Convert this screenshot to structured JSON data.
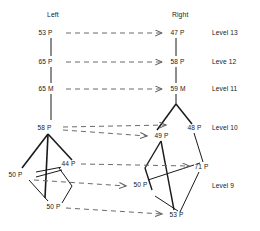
{
  "diagram": {
    "headers": [
      {
        "id": "left",
        "label": "Left",
        "x": 47,
        "y": 12
      },
      {
        "id": "right",
        "label": "Right",
        "x": 172,
        "y": 12
      }
    ],
    "levels": [
      {
        "id": "level-13",
        "label": "Level 13",
        "x": 212,
        "y": 33
      },
      {
        "id": "level-12",
        "label": "Leve 12",
        "x": 212,
        "y": 62
      },
      {
        "id": "level-11",
        "label": "Level 11",
        "x": 212,
        "y": 89
      },
      {
        "id": "level-10",
        "label": "Level 10",
        "x": 212,
        "y": 128
      },
      {
        "id": "level-9",
        "label": "Level 9",
        "x": 212,
        "y": 186
      }
    ],
    "nodes": [
      {
        "id": "n-l13",
        "label": "53 P",
        "side": "left",
        "level": "Level 13",
        "x": 47,
        "y": 33
      },
      {
        "id": "n-r13",
        "label": "47 P",
        "side": "right",
        "level": "Level 13",
        "x": 172,
        "y": 33
      },
      {
        "id": "n-l12",
        "label": "65 P",
        "side": "left",
        "level": "Leve 12",
        "x": 47,
        "y": 62
      },
      {
        "id": "n-r12",
        "label": "58 P",
        "side": "right",
        "level": "Leve 12",
        "x": 172,
        "y": 62
      },
      {
        "id": "n-l11",
        "label": "65 M",
        "side": "left",
        "level": "Level 11",
        "x": 47,
        "y": 89
      },
      {
        "id": "n-r11",
        "label": "59 M",
        "side": "right",
        "level": "Level 11",
        "x": 172,
        "y": 89
      },
      {
        "id": "n-l10",
        "label": "58 P",
        "side": "left",
        "level": "Level 10",
        "x": 44,
        "y": 128
      },
      {
        "id": "n-m10",
        "label": "49 P",
        "side": "right",
        "level": "Level 10",
        "x": 157,
        "y": 136
      },
      {
        "id": "n-r10",
        "label": "48 P",
        "side": "right",
        "level": "Level 10",
        "x": 190,
        "y": 128
      },
      {
        "id": "n-l9a",
        "label": "50 P",
        "side": "left",
        "level": "Level 9",
        "x": 15,
        "y": 175
      },
      {
        "id": "n-l9b",
        "label": "44 P",
        "side": "left",
        "level": "Level 9",
        "x": 63,
        "y": 164
      },
      {
        "id": "n-l9c",
        "label": "50 P",
        "side": "left",
        "level": "Level 9",
        "x": 49,
        "y": 207
      },
      {
        "id": "n-r9a",
        "label": "71 P",
        "side": "right",
        "level": "Level 9",
        "x": 196,
        "y": 167
      },
      {
        "id": "n-r9b",
        "label": "50 P",
        "side": "right",
        "level": "Level 9",
        "x": 136,
        "y": 185
      },
      {
        "id": "n-r9c",
        "label": "53 P",
        "side": "right",
        "level": "Level 9",
        "x": 172,
        "y": 215
      }
    ],
    "edges": {
      "solid_color": "#1a1a1a",
      "dashed_color": "#6a6a6a",
      "solid_count": 20,
      "dashed_count": 8
    },
    "colors": {
      "background": "#ffffff",
      "text": "#1a1a1a",
      "line_solid": "#1a1a1a",
      "line_dashed": "#6a6a6a"
    }
  }
}
